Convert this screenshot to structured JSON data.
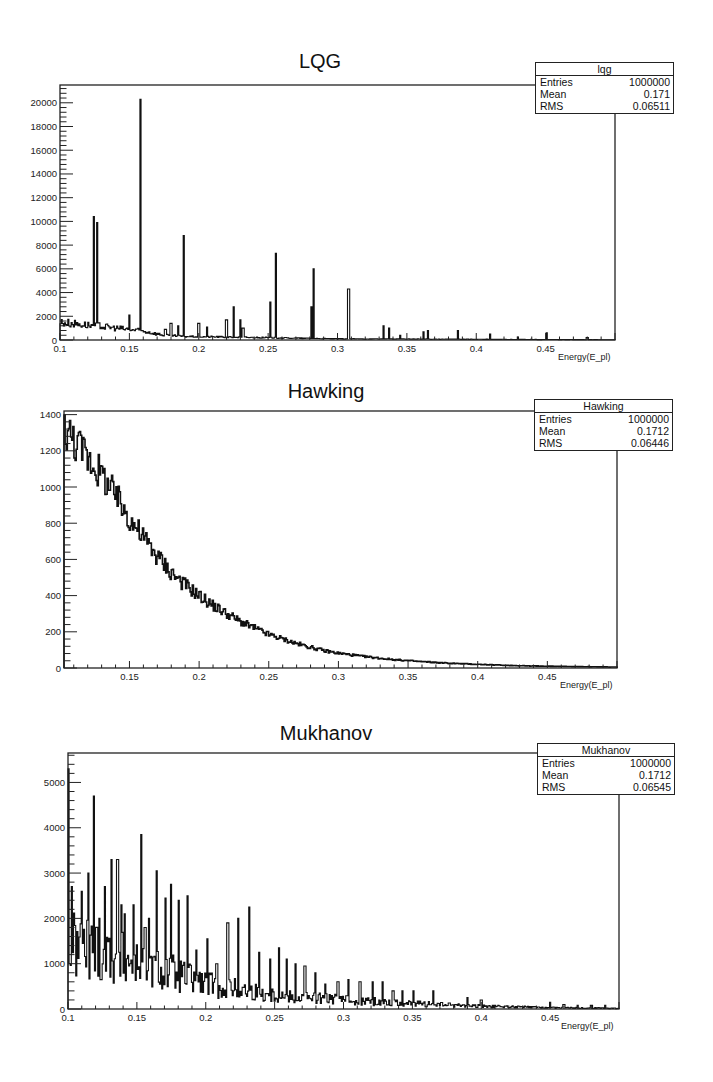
{
  "chart_data": [
    {
      "type": "bar",
      "id": "lqg",
      "title": "LQG",
      "xlabel": "Energy(E_pl)",
      "ylabel": "",
      "xlim": [
        0.1,
        0.5
      ],
      "ylim": [
        0,
        21500
      ],
      "xticks": [
        0.1,
        0.15,
        0.2,
        0.25,
        0.3,
        0.35,
        0.4,
        0.45
      ],
      "xtick_labels": [
        "0.1",
        "0.15",
        "0.2",
        "0.25",
        "0.3",
        "0.35",
        "0.4",
        "0.45"
      ],
      "yticks": [
        0,
        2000,
        4000,
        6000,
        8000,
        10000,
        12000,
        14000,
        16000,
        18000,
        20000
      ],
      "ytick_labels": [
        "0",
        "2000",
        "4000",
        "6000",
        "8000",
        "10000",
        "12000",
        "14000",
        "16000",
        "18000",
        "20000"
      ],
      "grid": false,
      "legend": "stats box top-right",
      "stats": {
        "name": "lqg",
        "entries": "1000000",
        "mean": "0.171",
        "rms": "0.06511"
      },
      "baseline": {
        "description": "Background continuum decreasing from ~1500 at 0.1 to ~0 near 0.2",
        "points": [
          [
            0.1,
            1500
          ],
          [
            0.13,
            1150
          ],
          [
            0.16,
            750
          ],
          [
            0.175,
            400
          ],
          [
            0.19,
            300
          ],
          [
            0.22,
            250
          ],
          [
            0.3,
            100
          ],
          [
            0.5,
            20
          ]
        ]
      },
      "peaks": [
        {
          "x": 0.1245,
          "y": 10400
        },
        {
          "x": 0.1265,
          "y": 9900
        },
        {
          "x": 0.15,
          "y": 2100
        },
        {
          "x": 0.158,
          "y": 20300
        },
        {
          "x": 0.176,
          "y": 900
        },
        {
          "x": 0.18,
          "y": 1400
        },
        {
          "x": 0.185,
          "y": 1200
        },
        {
          "x": 0.1895,
          "y": 8800
        },
        {
          "x": 0.2,
          "y": 1400
        },
        {
          "x": 0.206,
          "y": 1100
        },
        {
          "x": 0.22,
          "y": 1700
        },
        {
          "x": 0.2255,
          "y": 2800
        },
        {
          "x": 0.23,
          "y": 1700
        },
        {
          "x": 0.232,
          "y": 1000
        },
        {
          "x": 0.2515,
          "y": 3200
        },
        {
          "x": 0.2555,
          "y": 7300
        },
        {
          "x": 0.2815,
          "y": 2800
        },
        {
          "x": 0.283,
          "y": 6000
        },
        {
          "x": 0.308,
          "y": 4300
        },
        {
          "x": 0.333,
          "y": 1200
        },
        {
          "x": 0.337,
          "y": 1000
        },
        {
          "x": 0.345,
          "y": 400
        },
        {
          "x": 0.362,
          "y": 700
        },
        {
          "x": 0.365,
          "y": 800
        },
        {
          "x": 0.387,
          "y": 800
        },
        {
          "x": 0.41,
          "y": 500
        },
        {
          "x": 0.43,
          "y": 250
        },
        {
          "x": 0.451,
          "y": 600
        },
        {
          "x": 0.48,
          "y": 200
        }
      ]
    },
    {
      "type": "bar",
      "id": "hawking",
      "title": "Hawking",
      "xlabel": "Energy(E_pl)",
      "ylabel": "",
      "xlim": [
        0.103,
        0.5
      ],
      "ylim": [
        0,
        1420
      ],
      "xticks": [
        0.15,
        0.2,
        0.25,
        0.3,
        0.35,
        0.4,
        0.45
      ],
      "xtick_labels": [
        "0.15",
        "0.2",
        "0.25",
        "0.3",
        "0.35",
        "0.4",
        "0.45"
      ],
      "yticks": [
        0,
        200,
        400,
        600,
        800,
        1000,
        1200,
        1400
      ],
      "ytick_labels": [
        "0",
        "200",
        "400",
        "600",
        "800",
        "1000",
        "1200",
        "1400"
      ],
      "grid": false,
      "legend": "stats box top-right",
      "stats": {
        "name": "Hawking",
        "entries": "1000000",
        "mean": "0.1712",
        "rms": "0.06446"
      },
      "x": [
        0.103,
        0.11,
        0.12,
        0.13,
        0.14,
        0.15,
        0.16,
        0.17,
        0.18,
        0.19,
        0.2,
        0.21,
        0.22,
        0.23,
        0.24,
        0.25,
        0.26,
        0.27,
        0.28,
        0.29,
        0.3,
        0.32,
        0.34,
        0.36,
        0.38,
        0.4,
        0.42,
        0.44,
        0.46,
        0.48,
        0.5
      ],
      "values": [
        1330,
        1260,
        1170,
        1070,
        950,
        830,
        720,
        620,
        530,
        460,
        400,
        345,
        300,
        255,
        220,
        185,
        160,
        135,
        115,
        95,
        82,
        62,
        46,
        35,
        26,
        20,
        15,
        11,
        9,
        7,
        5
      ]
    },
    {
      "type": "bar",
      "id": "mukhanov",
      "title": "Mukhanov",
      "xlabel": "Energy(E_pl)",
      "ylabel": "",
      "xlim": [
        0.1,
        0.5
      ],
      "ylim": [
        0,
        5650
      ],
      "xticks": [
        0.1,
        0.15,
        0.2,
        0.25,
        0.3,
        0.35,
        0.4,
        0.45
      ],
      "xtick_labels": [
        "0.1",
        "0.15",
        "0.2",
        "0.25",
        "0.3",
        "0.35",
        "0.4",
        "0.45"
      ],
      "yticks": [
        0,
        1000,
        2000,
        3000,
        4000,
        5000
      ],
      "ytick_labels": [
        "0",
        "1000",
        "2000",
        "3000",
        "4000",
        "5000"
      ],
      "grid": false,
      "legend": "stats box top-right",
      "stats": {
        "name": "Mukhanov",
        "entries": "1000000",
        "mean": "0.1712",
        "rms": "0.06545"
      },
      "baseline": {
        "description": "Dense noisy continuum ~1400 at 0.1 decreasing to ~100 by 0.35",
        "points": [
          [
            0.1,
            1400
          ],
          [
            0.12,
            1300
          ],
          [
            0.15,
            1000
          ],
          [
            0.18,
            750
          ],
          [
            0.2,
            550
          ],
          [
            0.25,
            300
          ],
          [
            0.3,
            200
          ],
          [
            0.35,
            120
          ],
          [
            0.4,
            60
          ],
          [
            0.45,
            30
          ],
          [
            0.5,
            15
          ]
        ]
      },
      "peaks": [
        {
          "x": 0.1,
          "y": 5300
        },
        {
          "x": 0.103,
          "y": 2700
        },
        {
          "x": 0.11,
          "y": 2600
        },
        {
          "x": 0.1145,
          "y": 3000
        },
        {
          "x": 0.1185,
          "y": 4700
        },
        {
          "x": 0.1225,
          "y": 2000
        },
        {
          "x": 0.127,
          "y": 2700
        },
        {
          "x": 0.1315,
          "y": 3300
        },
        {
          "x": 0.136,
          "y": 3300
        },
        {
          "x": 0.1385,
          "y": 2300
        },
        {
          "x": 0.141,
          "y": 2100
        },
        {
          "x": 0.1475,
          "y": 2300
        },
        {
          "x": 0.1535,
          "y": 3850
        },
        {
          "x": 0.156,
          "y": 1800
        },
        {
          "x": 0.159,
          "y": 2000
        },
        {
          "x": 0.1645,
          "y": 3050
        },
        {
          "x": 0.1705,
          "y": 2450
        },
        {
          "x": 0.1745,
          "y": 2750
        },
        {
          "x": 0.1805,
          "y": 2400
        },
        {
          "x": 0.1865,
          "y": 2500
        },
        {
          "x": 0.1935,
          "y": 1300
        },
        {
          "x": 0.2015,
          "y": 1550
        },
        {
          "x": 0.208,
          "y": 1000
        },
        {
          "x": 0.216,
          "y": 1900
        },
        {
          "x": 0.2235,
          "y": 2000
        },
        {
          "x": 0.2315,
          "y": 2250
        },
        {
          "x": 0.2385,
          "y": 1250
        },
        {
          "x": 0.2465,
          "y": 1100
        },
        {
          "x": 0.2535,
          "y": 1350
        },
        {
          "x": 0.259,
          "y": 1100
        },
        {
          "x": 0.2655,
          "y": 1000
        },
        {
          "x": 0.272,
          "y": 950
        },
        {
          "x": 0.2795,
          "y": 800
        },
        {
          "x": 0.2865,
          "y": 550
        },
        {
          "x": 0.296,
          "y": 600
        },
        {
          "x": 0.3035,
          "y": 650
        },
        {
          "x": 0.312,
          "y": 600
        },
        {
          "x": 0.3215,
          "y": 600
        },
        {
          "x": 0.3285,
          "y": 600
        },
        {
          "x": 0.336,
          "y": 400
        },
        {
          "x": 0.3425,
          "y": 400
        },
        {
          "x": 0.351,
          "y": 400
        },
        {
          "x": 0.3655,
          "y": 400
        },
        {
          "x": 0.39,
          "y": 250
        },
        {
          "x": 0.4,
          "y": 200
        },
        {
          "x": 0.45,
          "y": 150
        },
        {
          "x": 0.46,
          "y": 100
        },
        {
          "x": 0.47,
          "y": 80
        },
        {
          "x": 0.48,
          "y": 80
        },
        {
          "x": 0.49,
          "y": 80
        }
      ]
    }
  ],
  "panels": [
    {
      "title": "LQG",
      "xlabel": "Energy(E_pl)",
      "stats": {
        "name": "lqg",
        "entries_label": "Entries",
        "entries": "1000000",
        "mean_label": "Mean",
        "mean": "0.171",
        "rms_label": "RMS",
        "rms": "0.06511"
      }
    },
    {
      "title": "Hawking",
      "xlabel": "Energy(E_pl)",
      "stats": {
        "name": "Hawking",
        "entries_label": "Entries",
        "entries": "1000000",
        "mean_label": "Mean",
        "mean": "0.1712",
        "rms_label": "RMS",
        "rms": "0.06446"
      }
    },
    {
      "title": "Mukhanov",
      "xlabel": "Energy(E_pl)",
      "stats": {
        "name": "Mukhanov",
        "entries_label": "Entries",
        "entries": "1000000",
        "mean_label": "Mean",
        "mean": "0.1712",
        "rms_label": "RMS",
        "rms": "0.06545"
      }
    }
  ],
  "colors": {
    "line": "#111111",
    "frame": "#222222",
    "background": "#ffffff"
  }
}
